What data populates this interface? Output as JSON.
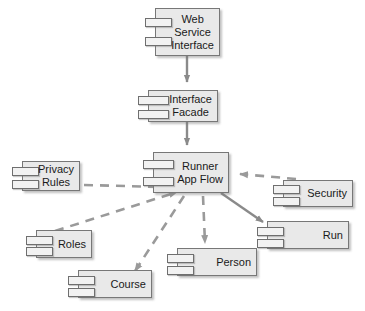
{
  "diagram": {
    "type": "uml-component-diagram",
    "colors": {
      "component_fill": "#e9e9e9",
      "component_border": "#777777",
      "stub_fill": "#f2f2f2",
      "edge_solid": "#808080",
      "edge_dashed": "#999999",
      "text": "#1a1a1a",
      "background": "#ffffff"
    },
    "components": [
      {
        "id": "web-service-interface",
        "lines": [
          "Web",
          "Service",
          "Interface"
        ],
        "x": 155,
        "y": 8,
        "w": 65,
        "h": 48
      },
      {
        "id": "interface-facade",
        "lines": [
          "Interface",
          "Facade"
        ],
        "x": 148,
        "y": 90,
        "w": 70,
        "h": 32
      },
      {
        "id": "runner-app-flow",
        "lines": [
          "Runner",
          "App Flow"
        ],
        "x": 153,
        "y": 152,
        "w": 76,
        "h": 41
      },
      {
        "id": "privacy-rules",
        "lines": [
          "Privacy",
          "Rules"
        ],
        "x": 22,
        "y": 161,
        "w": 58,
        "h": 30
      },
      {
        "id": "security",
        "lines": [
          "Security"
        ],
        "x": 283,
        "y": 180,
        "w": 70,
        "h": 27
      },
      {
        "id": "roles",
        "lines": [
          "Roles"
        ],
        "x": 36,
        "y": 230,
        "w": 56,
        "h": 28
      },
      {
        "id": "person",
        "lines": [
          "Person"
        ],
        "x": 177,
        "y": 248,
        "w": 80,
        "h": 28
      },
      {
        "id": "run",
        "lines": [
          "Run"
        ],
        "x": 267,
        "y": 221,
        "w": 82,
        "h": 28
      },
      {
        "id": "course",
        "lines": [
          "Course"
        ],
        "x": 78,
        "y": 270,
        "w": 74,
        "h": 28
      }
    ],
    "edges": [
      {
        "id": "wsi-to-facade",
        "from": "web-service-interface",
        "to": "interface-facade",
        "style": "solid",
        "arrow": "filled"
      },
      {
        "id": "facade-to-runner",
        "from": "interface-facade",
        "to": "runner-app-flow",
        "style": "solid",
        "arrow": "filled"
      },
      {
        "id": "privacy-to-runner",
        "from": "privacy-rules",
        "to": "runner-app-flow",
        "style": "dashed",
        "arrow": "filled"
      },
      {
        "id": "security-to-runner",
        "from": "security",
        "to": "runner-app-flow",
        "style": "dashed",
        "arrow": "filled"
      },
      {
        "id": "roles-to-runner",
        "from": "roles",
        "to": "runner-app-flow",
        "style": "dashed",
        "arrow": "filled"
      },
      {
        "id": "runner-to-course",
        "from": "runner-app-flow",
        "to": "course",
        "style": "dashed",
        "arrow": "filled"
      },
      {
        "id": "runner-to-person",
        "from": "runner-app-flow",
        "to": "person",
        "style": "dashed",
        "arrow": "filled"
      },
      {
        "id": "runner-to-run",
        "from": "runner-app-flow",
        "to": "run",
        "style": "solid",
        "arrow": "filled"
      }
    ]
  }
}
